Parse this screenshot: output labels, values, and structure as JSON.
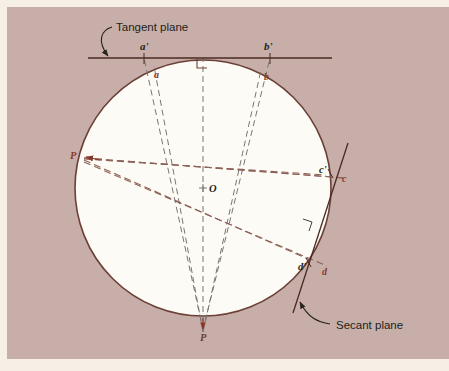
{
  "figure": {
    "canvas": {
      "width": 449,
      "height": 371
    },
    "colors": {
      "paper": "#f6efe6",
      "panel": "#c6ada6",
      "sphere_fill": "#fdfbf5",
      "circle_stroke": "#6b4036",
      "tangent_stroke": "#4a2a22",
      "secant_stroke": "#4a2a22",
      "dashed_ray": "#8d6258",
      "dashed_grey": "#7a7070",
      "label_dark": "#231f1c",
      "label_red": "#8a382c"
    },
    "panel": {
      "x": 7,
      "y": 7,
      "width": 442,
      "height": 352
    },
    "sphere": {
      "cx": 203,
      "cy": 188,
      "r": 128
    },
    "center_point": {
      "label": "O",
      "x": 203,
      "y": 188
    }
  },
  "callouts": [
    {
      "name": "tangent-plane",
      "text": "Tangent plane",
      "x": 111,
      "y": 27
    },
    {
      "name": "secant-plane",
      "text": "Secant plane",
      "x": 331,
      "y": 325
    }
  ],
  "point_labels": [
    {
      "name": "a-prime",
      "text": "a'",
      "x": 144,
      "y": 46,
      "color": "label_dark"
    },
    {
      "name": "b-prime",
      "text": "b'",
      "x": 267,
      "y": 46,
      "color": "label_dark"
    },
    {
      "name": "a",
      "text": "a",
      "x": 156,
      "y": 74,
      "color": "label_red"
    },
    {
      "name": "b",
      "text": "b",
      "x": 266,
      "y": 76,
      "color": "label_red"
    },
    {
      "name": "c-prime",
      "text": "c'",
      "x": 325,
      "y": 169,
      "color": "label_dark"
    },
    {
      "name": "c",
      "text": "c",
      "x": 345,
      "y": 178,
      "color": "label_red"
    },
    {
      "name": "d-prime",
      "text": "d'",
      "x": 305,
      "y": 266,
      "color": "label_dark"
    },
    {
      "name": "d",
      "text": "d",
      "x": 325,
      "y": 271,
      "color": "label_red"
    },
    {
      "name": "p-left",
      "text": "P",
      "x": 72,
      "y": 155,
      "color": "label_red"
    },
    {
      "name": "p-bottom",
      "text": "P",
      "x": 203,
      "y": 338,
      "color": "label_red"
    },
    {
      "name": "center-o",
      "text": "O",
      "x": 212,
      "y": 189,
      "color": "label_dark"
    }
  ],
  "tangent_line": {
    "x1": 88,
    "y1": 58,
    "x2": 332,
    "y2": 58
  },
  "secant_line": {
    "x1": 348,
    "y1": 143,
    "x2": 293,
    "y2": 313
  },
  "right_angle_markers": [
    {
      "name": "right-angle-tangent",
      "x": 203,
      "y": 58
    },
    {
      "name": "right-angle-secant",
      "x": 311,
      "y": 224
    }
  ],
  "rays_from_p_left": [
    {
      "name": "ray-p-to-c",
      "to_x": 345,
      "to_y": 178
    },
    {
      "name": "ray-p-to-cprime",
      "to_x": 325,
      "to_y": 172
    },
    {
      "name": "ray-p-to-d",
      "to_x": 325,
      "to_y": 268
    },
    {
      "name": "ray-p-to-dprime",
      "to_x": 305,
      "to_y": 262
    }
  ],
  "rays_from_p_bottom": [
    {
      "name": "ray-pb-to-a",
      "to_x": 152,
      "to_y": 67
    },
    {
      "name": "ray-pb-to-aprime",
      "to_x": 144,
      "to_y": 58
    },
    {
      "name": "ray-pb-to-b",
      "to_x": 262,
      "to_y": 70
    },
    {
      "name": "ray-pb-to-bprime",
      "to_x": 270,
      "to_y": 58
    },
    {
      "name": "ray-pb-vertical",
      "to_x": 203,
      "to_y": 58
    }
  ]
}
